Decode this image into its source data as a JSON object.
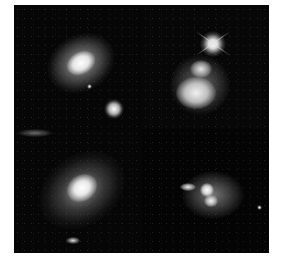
{
  "image": {
    "description": "Four grayscale telescope images of galaxies arranged in a 2x2 grid",
    "panels": [
      {
        "position": "top-left",
        "subject": "spiral galaxy with bright core and a small companion galaxy below right"
      },
      {
        "position": "top-right",
        "subject": "interacting galaxy pair with a bright diffraction-spiked star above"
      },
      {
        "position": "bottom-left",
        "subject": "elliptical galaxy with bright diffuse halo"
      },
      {
        "position": "bottom-right",
        "subject": "merging galaxy with two bright nuclei and a small elongated galaxy to the left"
      }
    ],
    "colors": {
      "background": "#ffffff",
      "sky": "#050505",
      "glow": "#f2f2f2"
    }
  }
}
